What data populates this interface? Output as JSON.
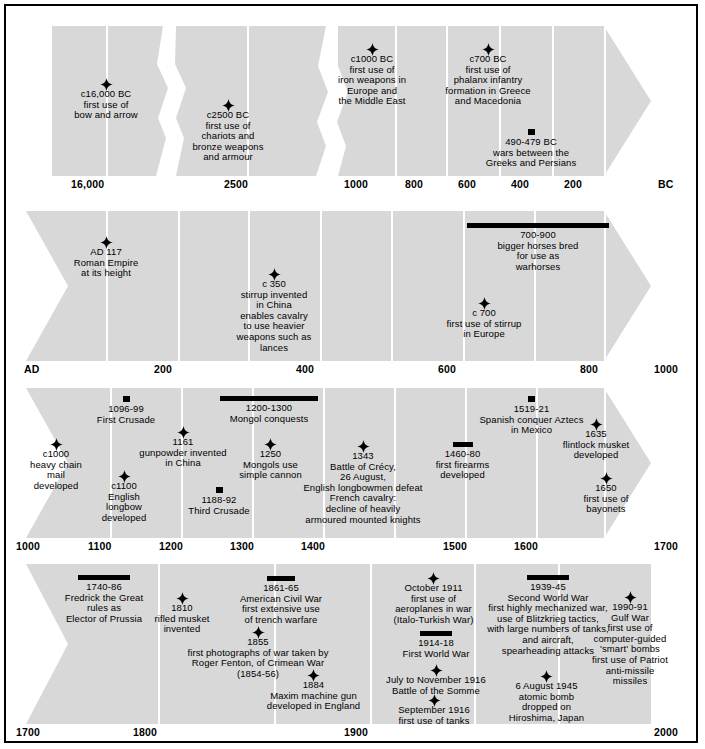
{
  "colors": {
    "band": "#d8d8d8",
    "divider": "#ffffff",
    "marker": "#000000",
    "text": "#000000",
    "border": "#000000"
  },
  "icons": {
    "star": "star-marker-icon",
    "square": "square-marker-icon",
    "bar": "duration-bar-icon"
  },
  "rows": [
    {
      "id": "row-bc",
      "era_label": "BC",
      "left_cap": "flat",
      "right_cap": "arrow",
      "ticks": [
        "16,000",
        "2500",
        "1000",
        "800",
        "600",
        "400",
        "200"
      ],
      "events": [
        {
          "marker": "star",
          "lines": [
            "c16,000 BC",
            "first use of",
            "bow and arrow"
          ]
        },
        {
          "marker": "star",
          "lines": [
            "c2500 BC",
            "first use of",
            "chariots and",
            "bronze weapons",
            "and armour"
          ]
        },
        {
          "marker": "star",
          "lines": [
            "c1000 BC",
            "first use of",
            "iron weapons in",
            "Europe and",
            "the Middle East"
          ]
        },
        {
          "marker": "star",
          "lines": [
            "c700 BC",
            "first use of",
            "phalanx infantry",
            "formation in Greece",
            "and Macedonia"
          ]
        },
        {
          "marker": "square",
          "lines": [
            "490-479 BC",
            "wars between the",
            "Greeks and Persians"
          ]
        }
      ]
    },
    {
      "id": "row-ad",
      "era_label": "AD",
      "left_cap": "notch",
      "right_cap": "arrow",
      "ticks": [
        "AD",
        "200",
        "400",
        "600",
        "800",
        "1000"
      ],
      "events": [
        {
          "marker": "star",
          "lines": [
            "AD 117",
            "Roman Empire",
            "at its height"
          ]
        },
        {
          "marker": "star",
          "lines": [
            "c 350",
            "stirrup invented",
            "in China",
            "enables cavalry",
            "to use heavier",
            "weapons such as",
            "lances"
          ]
        },
        {
          "marker": "bar",
          "lines": [
            "700-900",
            "bigger horses bred",
            "for use as",
            "warhorses"
          ]
        },
        {
          "marker": "star",
          "lines": [
            "c 700",
            "first use of stirrup",
            "in Europe"
          ]
        }
      ]
    },
    {
      "id": "row-medieval",
      "era_label": "",
      "left_cap": "notch",
      "right_cap": "arrow",
      "ticks": [
        "1000",
        "1100",
        "1200",
        "1300",
        "1400",
        "1500",
        "1600",
        "1700"
      ],
      "events": [
        {
          "marker": "star",
          "lines": [
            "c1000",
            "heavy chain",
            "mail",
            "developed"
          ]
        },
        {
          "marker": "square",
          "lines": [
            "1096-99",
            "First Crusade"
          ]
        },
        {
          "marker": "star",
          "lines": [
            "c1100",
            "English",
            "longbow",
            "developed"
          ]
        },
        {
          "marker": "star",
          "lines": [
            "1161",
            "gunpowder invented",
            "in China"
          ]
        },
        {
          "marker": "square",
          "lines": [
            "1188-92",
            "Third Crusade"
          ]
        },
        {
          "marker": "bar",
          "lines": [
            "1200-1300",
            "Mongol conquests"
          ]
        },
        {
          "marker": "star",
          "lines": [
            "1250",
            "Mongols use",
            "simple cannon"
          ]
        },
        {
          "marker": "star",
          "lines": [
            "1343",
            "Battle of Crécy,",
            "26 August,",
            "English longbowmen defeat",
            "French cavalry:",
            "decline of heavily",
            "armoured mounted knights"
          ]
        },
        {
          "marker": "bar",
          "lines": [
            "1460-80",
            "first firearms",
            "developed"
          ]
        },
        {
          "marker": "square",
          "lines": [
            "1519-21",
            "Spanish conquer Aztecs",
            "in Mexico"
          ]
        },
        {
          "marker": "star",
          "lines": [
            "1635",
            "flintlock musket",
            "developed"
          ]
        },
        {
          "marker": "star",
          "lines": [
            "1650",
            "first use of",
            "bayonets"
          ]
        }
      ]
    },
    {
      "id": "row-modern",
      "era_label": "",
      "left_cap": "notch",
      "right_cap": "flat",
      "ticks": [
        "1700",
        "1800",
        "1900",
        "2000"
      ],
      "events": [
        {
          "marker": "bar",
          "lines": [
            "1740-86",
            "Fredrick the Great",
            "rules as",
            "Elector of Prussia"
          ]
        },
        {
          "marker": "star",
          "lines": [
            "1810",
            "rifled musket",
            "invented"
          ]
        },
        {
          "marker": "bar",
          "lines": [
            "1861-65",
            "American Civil War",
            "first extensive use",
            "of trench warfare"
          ]
        },
        {
          "marker": "star",
          "lines": [
            "1855",
            "first photographs of war taken by",
            "Roger Fenton, of Crimean War",
            "(1854-56)"
          ]
        },
        {
          "marker": "star",
          "lines": [
            "1884",
            "Maxim machine gun",
            "developed in England"
          ]
        },
        {
          "marker": "star",
          "lines": [
            "October 1911",
            "first use of",
            "aeroplanes in war",
            "(Italo-Turkish War)"
          ]
        },
        {
          "marker": "bar",
          "lines": [
            "1914-18",
            "First World War"
          ]
        },
        {
          "marker": "star",
          "lines": [
            "July to November 1916",
            "Battle of the Somme"
          ]
        },
        {
          "marker": "star",
          "lines": [
            "September 1916",
            "first use of tanks"
          ]
        },
        {
          "marker": "bar",
          "lines": [
            "1939-45",
            "Second World War",
            "first highly mechanized war,",
            "use of Blitzkrieg tactics,",
            "with large numbers of tanks,",
            "and aircraft,",
            "spearheading attacks"
          ]
        },
        {
          "marker": "star",
          "lines": [
            "6 August 1945",
            "atomic bomb",
            "dropped on",
            "Hiroshima, Japan"
          ]
        },
        {
          "marker": "star",
          "lines": [
            "1990-91",
            "Gulf War",
            "first use of",
            "computer-guided",
            "'smart' bombs",
            "first use of Patriot",
            "anti-missile",
            "missiles"
          ]
        }
      ]
    }
  ]
}
